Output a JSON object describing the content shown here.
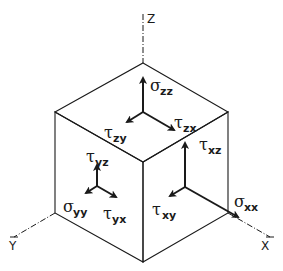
{
  "axes": {
    "z": "Z",
    "y": "Y",
    "x": "X"
  },
  "faces": {
    "top": {
      "normal_stress": {
        "symbol": "σ",
        "subscript": "zz"
      },
      "shear_1": {
        "symbol": "τ",
        "subscript": "zy"
      },
      "shear_2": {
        "symbol": "τ",
        "subscript": "zx"
      }
    },
    "left": {
      "normal_stress": {
        "symbol": "σ",
        "subscript": "yy"
      },
      "shear_1": {
        "symbol": "τ",
        "subscript": "yz"
      },
      "shear_2": {
        "symbol": "τ",
        "subscript": "yx"
      }
    },
    "right": {
      "normal_stress": {
        "symbol": "σ",
        "subscript": "xx"
      },
      "shear_1": {
        "symbol": "τ",
        "subscript": "xz"
      },
      "shear_2": {
        "symbol": "τ",
        "subscript": "xy"
      }
    }
  },
  "colors": {
    "line": "#1a1a1a",
    "background": "#ffffff"
  }
}
